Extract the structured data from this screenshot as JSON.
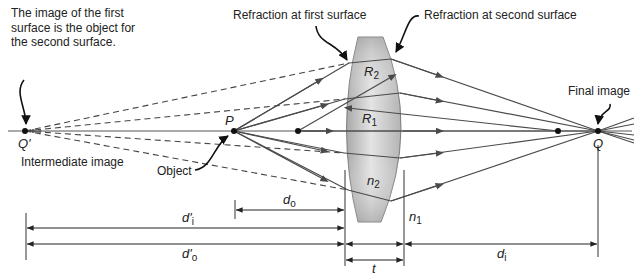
{
  "diagram": {
    "type": "thick-lens-two-surface-refraction",
    "colors": {
      "lens_fill": "#b8b8b8",
      "lens_highlight": "#e6e6e6",
      "ray": "#4a4a4a",
      "text": "#222222",
      "background": "#ffffff"
    },
    "annotations": {
      "top_left_note": "The image of the first surface is the object for the second surface.",
      "first_surface": "Refraction at first surface",
      "second_surface": "Refraction at second surface",
      "final_image": "Final image",
      "intermediate_image": "Intermediate image",
      "object": "Object"
    },
    "points": {
      "intermediate": "Q'",
      "object": "P",
      "final": "Q"
    },
    "labels": {
      "R2": {
        "base": "R",
        "sub": "2"
      },
      "R1": {
        "base": "R",
        "sub": "1"
      },
      "n2": {
        "base": "n",
        "sub": "2"
      },
      "n1": {
        "base": "n",
        "sub": "1"
      }
    },
    "dimensions": {
      "do": {
        "base": "d",
        "sub": "o"
      },
      "di_prime": {
        "base": "d'",
        "sub": "i"
      },
      "do_prime": {
        "base": "d'",
        "sub": "o"
      },
      "t": "t",
      "di": {
        "base": "d",
        "sub": "i"
      }
    }
  }
}
